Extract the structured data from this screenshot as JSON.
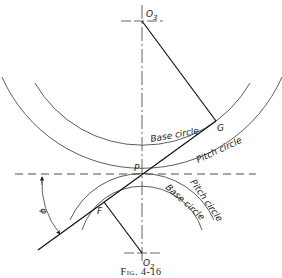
{
  "figure": {
    "caption": "Fig. 4-16",
    "points": {
      "O3": "O3",
      "O2": "O2",
      "P": "P",
      "G": "G",
      "F": "F"
    },
    "labels": {
      "upper_base_circle": "Base circle",
      "upper_pitch_circle": "Pitch circle",
      "lower_pitch_circle": "Pitch circle",
      "lower_base_circle": "Base circle",
      "pressure_angle": "φ"
    }
  },
  "colors": {
    "line": "#222222",
    "background": "#ffffff"
  }
}
